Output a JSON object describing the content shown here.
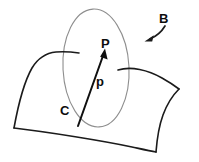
{
  "figure": {
    "kind": "line-drawing",
    "background_color": "#ffffff",
    "ink_color": "#1b1b1b",
    "faint_ink_color": "#8e8e8e",
    "labels": {
      "body": "B",
      "point": "P",
      "vector": "p",
      "origin": "C"
    },
    "annotations": {
      "body_pointer": "curved-arrow-to-surface",
      "position_vector": "arrow-from-C-to-P"
    },
    "elements": {
      "surface_name": "curved-surface",
      "region_name": "ellipse-region",
      "vector_name": "position-vector"
    }
  }
}
